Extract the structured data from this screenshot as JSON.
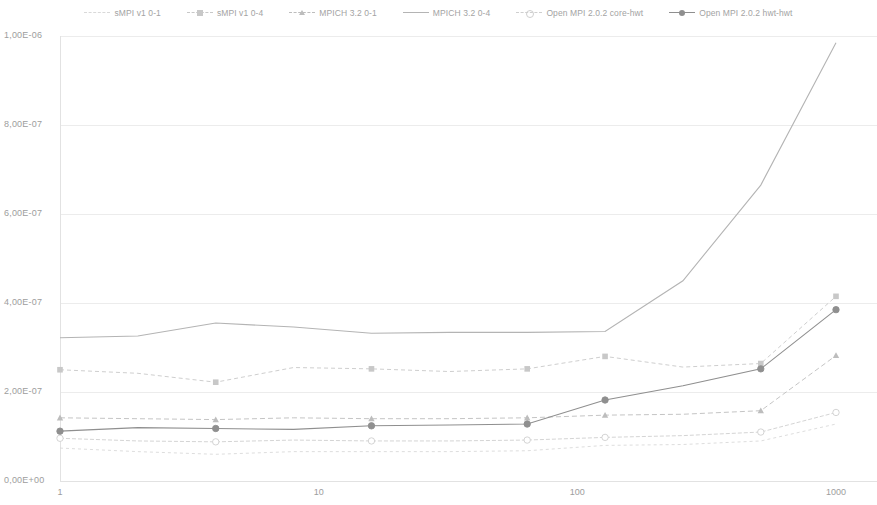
{
  "chart_data": {
    "type": "line",
    "title": "",
    "xlabel": "",
    "ylabel": "",
    "xscale": "log",
    "xlim": [
      1,
      1000
    ],
    "ylim": [
      0,
      1e-06
    ],
    "grid": true,
    "legend_position": "top",
    "x_tick_labels": [
      "1",
      "10",
      "100",
      "1000"
    ],
    "x_ticks": [
      1,
      10,
      100,
      1000
    ],
    "y_tick_labels": [
      "0,00E+00",
      "2,00E-07",
      "4,00E-07",
      "6,00E-07",
      "8,00E-07",
      "1,00E-06"
    ],
    "y_ticks": [
      0,
      2e-07,
      4e-07,
      6e-07,
      8e-07,
      1e-06
    ],
    "x": [
      1,
      2,
      4,
      8,
      16,
      32,
      64,
      128,
      256,
      512,
      1000
    ],
    "series": [
      {
        "name": "sMPI v1 0-1",
        "color": "#d9d9d9",
        "dash": "3,3",
        "marker": "none",
        "values": [
          7.4e-08,
          6.6e-08,
          6e-08,
          6.6e-08,
          6.6e-08,
          6.6e-08,
          6.8e-08,
          8e-08,
          8.2e-08,
          9e-08,
          1.28e-07
        ]
      },
      {
        "name": "sMPI v1 0-4",
        "color": "#c8c8c8",
        "dash": "4,3",
        "marker": "square",
        "values": [
          2.5e-07,
          2.42e-07,
          2.22e-07,
          2.55e-07,
          2.52e-07,
          2.46e-07,
          2.52e-07,
          2.8e-07,
          2.56e-07,
          2.64e-07,
          4.15e-07
        ]
      },
      {
        "name": "MPICH 3.2 0-1",
        "color": "#bdbdbd",
        "dash": "5,3",
        "marker": "triangle",
        "values": [
          1.42e-07,
          1.4e-07,
          1.38e-07,
          1.42e-07,
          1.4e-07,
          1.4e-07,
          1.42e-07,
          1.48e-07,
          1.5e-07,
          1.58e-07,
          2.82e-07
        ]
      },
      {
        "name": "MPICH 3.2 0-4",
        "color": "#b4b4b4",
        "dash": "none",
        "marker": "none",
        "values": [
          3.22e-07,
          3.26e-07,
          3.55e-07,
          3.46e-07,
          3.32e-07,
          3.34e-07,
          3.34e-07,
          3.36e-07,
          4.5e-07,
          6.65e-07,
          9.85e-07
        ]
      },
      {
        "name": "Open MPI 2.0.2 core-hwt",
        "color": "#cfcfcf",
        "dash": "4,2",
        "marker": "circle-open",
        "values": [
          9.6e-08,
          9e-08,
          8.8e-08,
          9.2e-08,
          9e-08,
          9e-08,
          9.2e-08,
          9.8e-08,
          1.02e-07,
          1.1e-07,
          1.54e-07
        ]
      },
      {
        "name": "Open MPI 2.0.2 hwt-hwt",
        "color": "#8f8f8f",
        "dash": "none",
        "marker": "circle",
        "values": [
          1.12e-07,
          1.2e-07,
          1.18e-07,
          1.16e-07,
          1.24e-07,
          1.26e-07,
          1.28e-07,
          1.82e-07,
          2.14e-07,
          2.52e-07,
          3.85e-07
        ]
      }
    ]
  },
  "legend": {
    "items": [
      {
        "label": "sMPI v1 0-1"
      },
      {
        "label": "sMPI v1 0-4"
      },
      {
        "label": "MPICH 3.2 0-1"
      },
      {
        "label": "MPICH 3.2 0-4"
      },
      {
        "label": "Open MPI 2.0.2 core-hwt"
      },
      {
        "label": "Open MPI 2.0.2 hwt-hwt"
      }
    ]
  },
  "axes": {
    "y_labels": [
      "1,00E-06",
      "8,00E-07",
      "6,00E-07",
      "4,00E-07",
      "2,00E-07",
      "0,00E+00"
    ],
    "x_labels": [
      "1",
      "10",
      "100",
      "1000"
    ]
  },
  "colors": {
    "grid": "#ececec",
    "axis": "#e2e2e2",
    "text": "#9d9d9d"
  }
}
